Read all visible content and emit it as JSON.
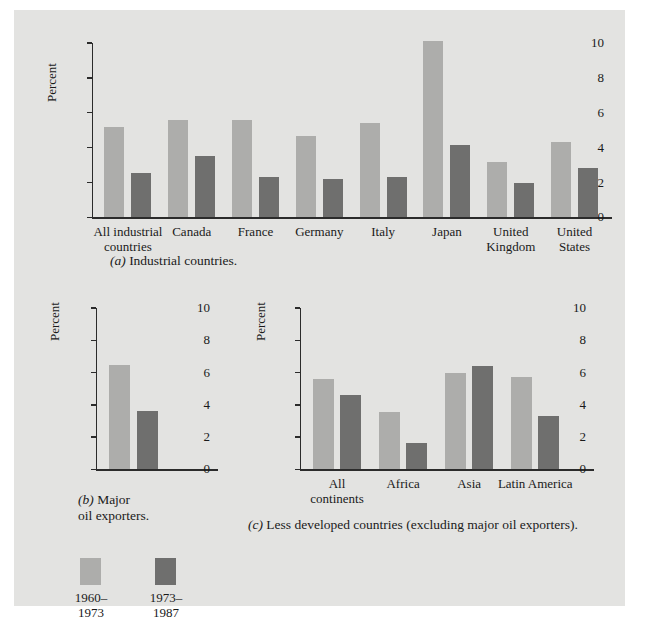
{
  "figure": {
    "background": "#e3e3e1",
    "series_colors": [
      "#adadab",
      "#6f6f6e"
    ]
  },
  "legend": {
    "items": [
      {
        "label": "1960–\n1973",
        "color": "#adadab"
      },
      {
        "label": "1973–\n1987",
        "color": "#6f6f6e"
      }
    ]
  },
  "panel_a": {
    "caption_marker": "(a)",
    "caption_text": "Industrial countries.",
    "chart": {
      "type": "bar",
      "title": "",
      "xlabel": "",
      "ylabel": "Percent",
      "ylim": [
        0,
        10
      ],
      "yticks": [
        0,
        2,
        4,
        6,
        8,
        10
      ],
      "ytick_labels": [
        "0",
        "2",
        "4",
        "6",
        "8",
        "10"
      ],
      "grid": false,
      "legend_position": "bottom",
      "categories": [
        "All industrial\ncountries",
        "Canada",
        "France",
        "Germany",
        "Italy",
        "Japan",
        "United\nKingdom",
        "United\nStates"
      ],
      "series": [
        {
          "name": "1960–1973",
          "values": [
            5.2,
            5.6,
            5.6,
            4.65,
            5.4,
            10.1,
            3.15,
            4.3
          ]
        },
        {
          "name": "1973–1987",
          "values": [
            2.55,
            3.5,
            2.3,
            2.2,
            2.3,
            4.15,
            1.95,
            2.85
          ]
        }
      ]
    }
  },
  "panel_b": {
    "caption_marker": "(b)",
    "caption_text": "Major\noil exporters.",
    "chart": {
      "type": "bar",
      "title": "",
      "xlabel": "",
      "ylabel": "Percent",
      "ylim": [
        0,
        10
      ],
      "yticks": [
        0,
        2,
        4,
        6,
        8,
        10
      ],
      "ytick_labels": [
        "0",
        "2",
        "4",
        "6",
        "8",
        "10"
      ],
      "grid": false,
      "legend_position": "bottom",
      "categories": [
        ""
      ],
      "series": [
        {
          "name": "1960–1973",
          "values": [
            6.5
          ]
        },
        {
          "name": "1973–1987",
          "values": [
            3.65
          ]
        }
      ]
    }
  },
  "panel_c": {
    "caption_marker": "(c)",
    "caption_text": "Less developed countries (excluding major oil exporters).",
    "chart": {
      "type": "bar",
      "title": "",
      "xlabel": "",
      "ylabel": "Percent",
      "ylim": [
        0,
        10
      ],
      "yticks": [
        0,
        2,
        4,
        6,
        8,
        10
      ],
      "ytick_labels": [
        "0",
        "2",
        "4",
        "6",
        "8",
        "10"
      ],
      "grid": false,
      "legend_position": "bottom",
      "categories": [
        "All\ncontinents",
        "Africa",
        "Asia",
        "Latin America"
      ],
      "series": [
        {
          "name": "1960–1973",
          "values": [
            5.6,
            3.55,
            6.0,
            5.7
          ]
        },
        {
          "name": "1973–1987",
          "values": [
            4.6,
            1.65,
            6.4,
            3.3
          ]
        }
      ]
    }
  }
}
